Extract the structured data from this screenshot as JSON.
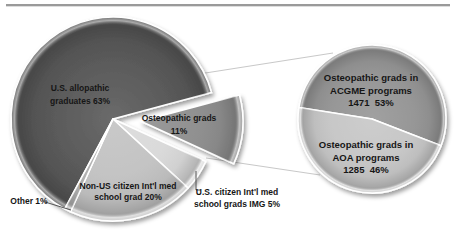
{
  "page": {
    "background": "#ffffff",
    "top_rule_color": "#9a9a9a"
  },
  "chart_data": {
    "type": "pie",
    "subtype": "pie-of-pie",
    "title": "",
    "legend": "none",
    "labels_on_slices": true,
    "connector_color": "#c8c8c8",
    "leader_color": "#555555",
    "main_pie": {
      "start_deg": 208.2,
      "slices": [
        {
          "name": "us-allopathic-graduates",
          "label": "U.S. allopathic\ngraduates 63%",
          "pct": 63,
          "color": "#565656",
          "exploded": false
        },
        {
          "name": "osteopathic-grads",
          "label": "Osteopathic grads\n11%",
          "pct": 11,
          "color": "#8d8d8d",
          "exploded": true
        },
        {
          "name": "us-citizen-intl-med-img",
          "label": "U.S. citizen Int'l med\nschool grads IMG 5%",
          "pct": 5,
          "color": "#d9d9d9",
          "exploded": false
        },
        {
          "name": "non-us-citizen-intl-med",
          "label": "Non-US citizen Int'l med\nschool grad 20%",
          "pct": 20,
          "color": "#c2c2c2",
          "exploded": false
        },
        {
          "name": "other",
          "label": "Other 1%",
          "pct": 1,
          "color": "#b0b0b0",
          "exploded": false
        }
      ]
    },
    "secondary_pie": {
      "start_deg": 279,
      "slices": [
        {
          "name": "osteopathic-grads-acgme",
          "label": "Osteopathic grads in\nACGME programs\n1471  53%",
          "value": 1471,
          "pct": 53,
          "color": "#949494"
        },
        {
          "name": "osteopathic-grads-aoa",
          "label": "Osteopathic grads in\nAOA programs\n1285  46%",
          "value": 1285,
          "pct": 46,
          "color": "#c6c6c6"
        }
      ]
    }
  }
}
